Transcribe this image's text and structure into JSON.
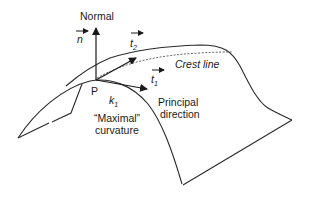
{
  "diagram": {
    "labels": {
      "normal": "Normal",
      "n": "n",
      "t2": "t",
      "t2_sub": "2",
      "t1": "t",
      "t1_sub": "1",
      "crest_line": "Crest line",
      "point": "P",
      "k1": "k",
      "k1_sub": "1",
      "maximal": "“Maximal”",
      "curvature": "curvature",
      "principal": "Principal",
      "direction": "direction"
    },
    "colors": {
      "stroke": "#2a2a2a",
      "background": "#ffffff"
    }
  }
}
